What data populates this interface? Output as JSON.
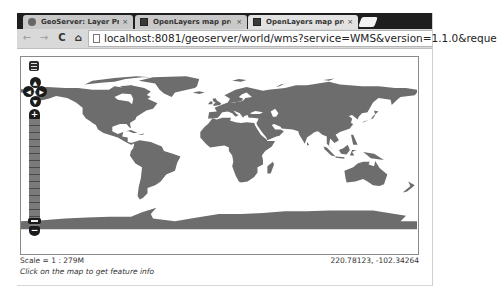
{
  "browser": {
    "tabs": [
      {
        "title": "GeoServer: Layer Previ",
        "icon": "geoserver-icon",
        "active": false
      },
      {
        "title": "OpenLayers map previ",
        "icon": "openlayers-icon",
        "active": false
      },
      {
        "title": "OpenLayers map previ",
        "icon": "openlayers-icon",
        "active": true
      }
    ],
    "close_glyph": "×",
    "nav": {
      "back": "←",
      "forward": "→",
      "reload": "C",
      "home": "⌂"
    },
    "url": "localhost:8081/geoserver/world/wms?service=WMS&version=1.1.0&reque"
  },
  "map": {
    "land_color": "#6d6d6d",
    "water_color": "#ffffff",
    "controls": {
      "pan_up": "▲",
      "pan_down": "▼",
      "pan_left": "◀",
      "pan_right": "▶",
      "zoom_in": "+",
      "zoom_out": "−"
    }
  },
  "status": {
    "scale": "Scale = 1 : 279M",
    "hint": "Click on the map to get feature info",
    "coordinates": "220.78123, -102.34264"
  }
}
